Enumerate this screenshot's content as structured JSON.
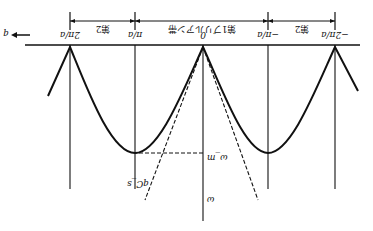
{
  "figure": {
    "orientation": "rotated-180",
    "axis_direction_label": "q",
    "zones": [
      {
        "label": "第2",
        "from": "2π/a",
        "to": "π/a"
      },
      {
        "label": "第1ブリルアン帯",
        "from": "π/a",
        "to": "−π/a"
      },
      {
        "label": "第2",
        "from": "−π/a",
        "to": "−2π/a"
      }
    ],
    "q_ticks": [
      "2π/a",
      "π/a",
      "0",
      "−π/a",
      "−2π/a"
    ],
    "omega_label": "ω",
    "omega_max_label": "ω_m",
    "sound_line_label": "qC_s"
  }
}
